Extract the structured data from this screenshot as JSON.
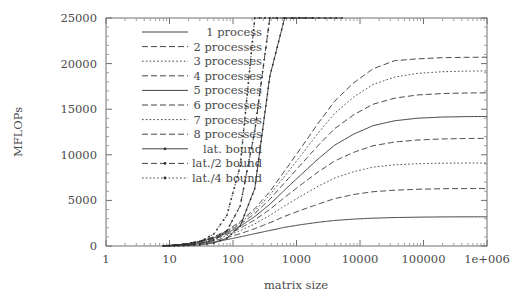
{
  "chart_data": {
    "type": "line",
    "title": "",
    "xlabel": "matrix size",
    "ylabel": "MFLOPs",
    "xscale": "log",
    "yscale": "linear",
    "xlim": [
      1,
      1000000
    ],
    "ylim": [
      0,
      25000
    ],
    "xticks": [
      1,
      10,
      100,
      1000,
      10000,
      100000,
      1000000
    ],
    "xticklabels": [
      "1",
      "10",
      "100",
      "1000",
      "10000",
      "100000",
      "1e+006"
    ],
    "yticks": [
      0,
      5000,
      10000,
      15000,
      20000,
      25000
    ],
    "yticklabels": [
      "0",
      "5000",
      "10000",
      "15000",
      "20000",
      "25000"
    ],
    "grid": false,
    "legend_position": "top-center-left",
    "series": [
      {
        "name": "1 process",
        "style": "solid",
        "marker": "none",
        "plateau": 3200,
        "x": [
          8,
          10,
          14,
          20,
          30,
          50,
          80,
          130,
          220,
          380,
          650,
          1200,
          2200,
          4000,
          8000,
          16000,
          35000,
          80000,
          200000,
          500000,
          1000000
        ],
        "y": [
          20,
          40,
          80,
          150,
          260,
          450,
          700,
          1000,
          1350,
          1700,
          2050,
          2350,
          2600,
          2800,
          2950,
          3050,
          3120,
          3160,
          3190,
          3200,
          3200
        ]
      },
      {
        "name": "2 processes",
        "style": "dashed",
        "marker": "none",
        "plateau": 6300,
        "x": [
          8,
          10,
          14,
          20,
          30,
          50,
          80,
          130,
          220,
          380,
          650,
          1200,
          2200,
          4000,
          8000,
          16000,
          35000,
          80000,
          200000,
          500000,
          1000000
        ],
        "y": [
          25,
          50,
          100,
          190,
          330,
          580,
          920,
          1350,
          1900,
          2550,
          3250,
          3950,
          4600,
          5200,
          5650,
          5950,
          6120,
          6220,
          6280,
          6300,
          6300
        ]
      },
      {
        "name": "3 processes",
        "style": "dotted",
        "marker": "none",
        "plateau": 9100,
        "x": [
          8,
          10,
          14,
          20,
          30,
          50,
          80,
          130,
          220,
          380,
          650,
          1200,
          2200,
          4000,
          8000,
          16000,
          35000,
          80000,
          200000,
          500000,
          1000000
        ],
        "y": [
          28,
          58,
          118,
          225,
          395,
          700,
          1120,
          1680,
          2420,
          3350,
          4400,
          5500,
          6550,
          7450,
          8150,
          8650,
          8900,
          9020,
          9080,
          9100,
          9100
        ]
      },
      {
        "name": "4 processes",
        "style": "dashed",
        "marker": "none",
        "plateau": 11800,
        "x": [
          8,
          10,
          14,
          20,
          30,
          50,
          80,
          130,
          220,
          380,
          650,
          1200,
          2200,
          4000,
          8000,
          16000,
          35000,
          80000,
          200000,
          500000,
          1000000
        ],
        "y": [
          30,
          62,
          128,
          248,
          440,
          790,
          1280,
          1950,
          2860,
          4010,
          5330,
          6760,
          8130,
          9330,
          10280,
          10990,
          11400,
          11620,
          11740,
          11790,
          11800
        ]
      },
      {
        "name": "5 processes",
        "style": "solid",
        "marker": "none",
        "plateau": 14200,
        "x": [
          8,
          10,
          14,
          20,
          30,
          50,
          80,
          130,
          220,
          380,
          650,
          1200,
          2200,
          4000,
          8000,
          16000,
          35000,
          80000,
          200000,
          500000,
          1000000
        ],
        "y": [
          32,
          66,
          136,
          266,
          475,
          860,
          1410,
          2170,
          3220,
          4570,
          6140,
          7870,
          9560,
          11060,
          12280,
          13190,
          13730,
          14010,
          14140,
          14190,
          14200
        ]
      },
      {
        "name": "6 processes",
        "style": "dashed",
        "marker": "none",
        "plateau": 16800,
        "x": [
          8,
          10,
          14,
          20,
          30,
          50,
          80,
          130,
          220,
          380,
          650,
          1200,
          2200,
          4000,
          8000,
          16000,
          35000,
          80000,
          200000,
          500000,
          1000000
        ],
        "y": [
          34,
          70,
          144,
          282,
          506,
          922,
          1525,
          2370,
          3560,
          5110,
          6940,
          9000,
          11040,
          12880,
          14400,
          15540,
          16210,
          16560,
          16720,
          16780,
          16800
        ]
      },
      {
        "name": "7 processes",
        "style": "dotted",
        "marker": "none",
        "plateau": 19200,
        "x": [
          8,
          10,
          14,
          20,
          30,
          50,
          80,
          130,
          220,
          380,
          650,
          1200,
          2200,
          4000,
          8000,
          16000,
          35000,
          80000,
          200000,
          500000,
          1000000
        ],
        "y": [
          35,
          73,
          150,
          295,
          532,
          975,
          1625,
          2545,
          3860,
          5590,
          7660,
          10020,
          12390,
          14550,
          16350,
          17710,
          18520,
          18930,
          19110,
          19180,
          19200
        ]
      },
      {
        "name": "8 processes",
        "style": "dashed",
        "marker": "none",
        "plateau": 20700,
        "x": [
          8,
          10,
          14,
          20,
          30,
          50,
          80,
          130,
          220,
          380,
          650,
          1200,
          2200,
          4000,
          8000,
          16000,
          35000,
          80000,
          200000,
          500000,
          1000000
        ],
        "y": [
          36,
          75,
          155,
          305,
          552,
          1015,
          1700,
          2680,
          4090,
          5960,
          8220,
          10840,
          13470,
          15890,
          17910,
          19430,
          20320,
          20520,
          20650,
          20690,
          20700
        ]
      },
      {
        "name": "lat. bound",
        "style": "solid",
        "marker": "plus",
        "x": [
          8,
          10,
          14,
          20,
          30,
          50,
          80,
          130,
          220,
          380,
          650,
          1100,
          1800,
          2800,
          4200,
          5200
        ],
        "y": [
          5,
          10,
          25,
          55,
          120,
          330,
          840,
          2200,
          6300,
          18600,
          25000,
          25000,
          25000,
          25000,
          25000,
          25000
        ]
      },
      {
        "name": "lat./2 bound",
        "style": "dashed",
        "marker": "plus",
        "x": [
          8,
          10,
          14,
          20,
          30,
          50,
          80,
          130,
          220,
          380,
          650,
          1100,
          1800
        ],
        "y": [
          10,
          20,
          50,
          110,
          240,
          660,
          1680,
          4400,
          12600,
          25000,
          25000,
          25000,
          25000
        ]
      },
      {
        "name": "lat./4 bound",
        "style": "dotted",
        "marker": "plus",
        "x": [
          8,
          10,
          14,
          20,
          30,
          50,
          80,
          130,
          220,
          380,
          650
        ],
        "y": [
          20,
          40,
          100,
          220,
          480,
          1320,
          3360,
          8800,
          25000,
          25000,
          25000
        ]
      }
    ],
    "legend_entries": [
      {
        "label": "1 process",
        "style": "solid",
        "marker": "none"
      },
      {
        "label": "2 processes",
        "style": "dashed",
        "marker": "none"
      },
      {
        "label": "3 processes",
        "style": "dotted",
        "marker": "none"
      },
      {
        "label": "4 processes",
        "style": "dashed",
        "marker": "none"
      },
      {
        "label": "5 processes",
        "style": "solid",
        "marker": "none"
      },
      {
        "label": "6 processes",
        "style": "dashed",
        "marker": "none"
      },
      {
        "label": "7 processes",
        "style": "dotted",
        "marker": "none"
      },
      {
        "label": "8 processes",
        "style": "dashed",
        "marker": "none"
      },
      {
        "label": "lat. bound",
        "style": "solid",
        "marker": "plus"
      },
      {
        "label": "lat./2 bound",
        "style": "dashed",
        "marker": "plus"
      },
      {
        "label": "lat./4 bound",
        "style": "dotted",
        "marker": "plus"
      }
    ],
    "colors": {
      "curve": "#2f2f2f",
      "axis": "#707070",
      "text": "#4a4a4a",
      "background": "#ffffff"
    }
  }
}
